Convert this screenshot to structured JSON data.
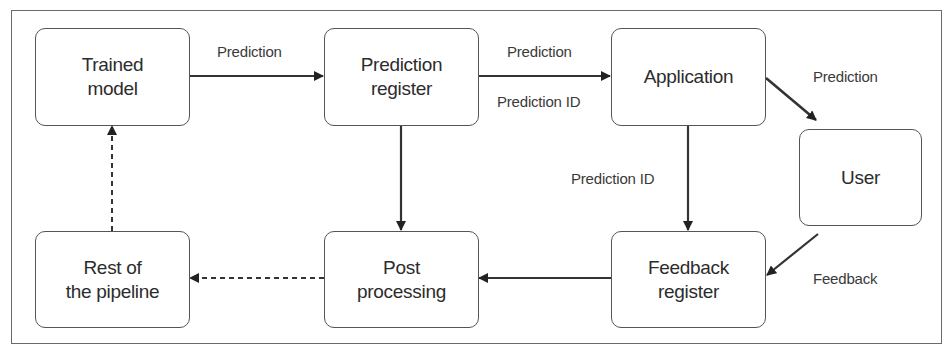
{
  "diagram": {
    "type": "flowchart",
    "nodes": {
      "trained_model": "Trained\nmodel",
      "prediction_register": "Prediction\nregister",
      "application": "Application",
      "user": "User",
      "rest_of_pipeline": "Rest of\nthe pipeline",
      "post_processing": "Post\nprocessing",
      "feedback_register": "Feedback\nregister"
    },
    "edge_labels": {
      "model_to_register": "Prediction",
      "register_to_app_top": "Prediction",
      "register_to_app_bottom": "Prediction ID",
      "app_to_user": "Prediction",
      "app_to_feedback": "Prediction ID",
      "user_to_feedback": "Feedback"
    },
    "edges": [
      {
        "from": "trained_model",
        "to": "prediction_register",
        "label": "Prediction",
        "style": "solid"
      },
      {
        "from": "prediction_register",
        "to": "application",
        "label": "Prediction / Prediction ID",
        "style": "solid"
      },
      {
        "from": "application",
        "to": "user",
        "label": "Prediction",
        "style": "solid"
      },
      {
        "from": "application",
        "to": "feedback_register",
        "label": "Prediction ID",
        "style": "solid"
      },
      {
        "from": "user",
        "to": "feedback_register",
        "label": "Feedback",
        "style": "solid"
      },
      {
        "from": "prediction_register",
        "to": "post_processing",
        "label": "",
        "style": "solid"
      },
      {
        "from": "feedback_register",
        "to": "post_processing",
        "label": "",
        "style": "solid"
      },
      {
        "from": "post_processing",
        "to": "rest_of_pipeline",
        "label": "",
        "style": "dashed"
      },
      {
        "from": "rest_of_pipeline",
        "to": "trained_model",
        "label": "",
        "style": "dashed"
      }
    ]
  }
}
